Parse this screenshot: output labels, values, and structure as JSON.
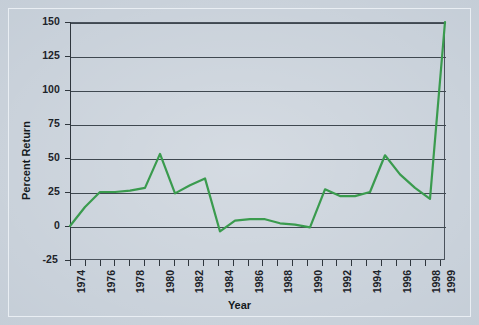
{
  "figure": {
    "background_color": "#c3ccd6",
    "line_color": "#3a9b4e",
    "axis_color": "#3f4850"
  },
  "chart_data": {
    "type": "line",
    "title": "",
    "xlabel": "Year",
    "ylabel": "Percent Return",
    "xlim": [
      1974,
      1999
    ],
    "ylim": [
      -25,
      150
    ],
    "grid": true,
    "legend": null,
    "yticks": [
      150,
      125,
      100,
      75,
      50,
      25,
      0,
      -25
    ],
    "ytick_labels": [
      "150",
      "125",
      "100",
      "75",
      "50",
      "25",
      "0",
      "-25"
    ],
    "xticks": [
      1974,
      1976,
      1978,
      1980,
      1982,
      1984,
      1986,
      1988,
      1990,
      1992,
      1994,
      1996,
      1998,
      1999
    ],
    "xtick_labels": [
      "1974",
      "1976",
      "1978",
      "1980",
      "1982",
      "1984",
      "1986",
      "1988",
      "1990",
      "1992",
      "1994",
      "1996",
      "1998",
      "1999"
    ],
    "x": [
      1974,
      1975,
      1976,
      1977,
      1978,
      1979,
      1980,
      1981,
      1982,
      1983,
      1984,
      1985,
      1986,
      1987,
      1988,
      1989,
      1990,
      1991,
      1992,
      1993,
      1994,
      1995,
      1996,
      1997,
      1998,
      1999
    ],
    "values": [
      0,
      14,
      25,
      25,
      26,
      28,
      53,
      24,
      30,
      35,
      -4,
      4,
      5,
      5,
      2,
      1,
      -1,
      27,
      22,
      22,
      25,
      52,
      38,
      28,
      20,
      150
    ],
    "series": [
      {
        "name": "Percent Return",
        "color": "#3a9b4e",
        "values": [
          0,
          14,
          25,
          25,
          26,
          28,
          53,
          24,
          30,
          35,
          -4,
          4,
          5,
          5,
          2,
          1,
          -1,
          27,
          22,
          22,
          25,
          52,
          38,
          28,
          20,
          150
        ]
      }
    ]
  }
}
